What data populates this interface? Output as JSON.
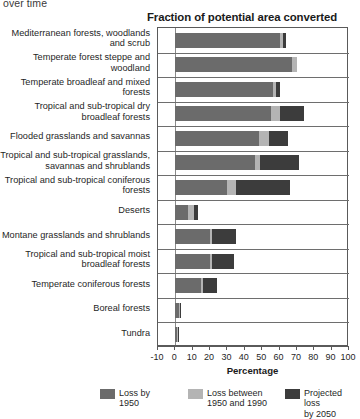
{
  "caption_fragment": "over time",
  "chart_data": {
    "type": "bar",
    "orientation": "horizontal",
    "stacked": true,
    "title": "Fraction of potential area converted",
    "xlabel": "Percentage",
    "ylabel": "",
    "xlim": [
      -10,
      100
    ],
    "xticks": [
      -10,
      0,
      10,
      20,
      30,
      40,
      50,
      60,
      70,
      80,
      90,
      100
    ],
    "xtick_labels": [
      "-10",
      "0",
      "10",
      "20",
      "30",
      "40",
      "50",
      "60",
      "70",
      "80",
      "90",
      "100"
    ],
    "grid": false,
    "legend_position": "bottom",
    "categories": [
      "Mediterranean forests, woodlands and scrub",
      "Temperate forest steppe and woodland",
      "Temperate broadleaf and mixed forests",
      "Tropical and sub-tropical dry broadleaf forests",
      "Flooded grasslands and savannas",
      "Tropical and sub-tropical grasslands, savannas and shrublands",
      "Tropical and sub-tropical coniferous forests",
      "Deserts",
      "Montane grasslands and shrublands",
      "Tropical and sub-tropical moist broadleaf forests",
      "Temperate coniferous forests",
      "Boreal forests",
      "Tundra"
    ],
    "series": [
      {
        "name": "Loss by 1950",
        "color": "#6b6b6b",
        "values": [
          60,
          67,
          56,
          55,
          48,
          46,
          30,
          7,
          20,
          20,
          15,
          2,
          1
        ]
      },
      {
        "name": "Loss between 1950 and 1990",
        "color": "#b4b4b4",
        "values": [
          2,
          3,
          2,
          5,
          6,
          3,
          5,
          4,
          1,
          1,
          1,
          0.5,
          0.3
        ]
      },
      {
        "name": "Projected loss by 2050",
        "color": "#3c3c3c",
        "values": [
          2,
          0,
          2,
          14,
          11,
          22,
          31,
          2,
          14,
          13,
          8,
          0.5,
          0.3
        ]
      }
    ],
    "totals": [
      64,
      70,
      60,
      74,
      65,
      71,
      66,
      13,
      35,
      34,
      24,
      3,
      1.6
    ]
  }
}
